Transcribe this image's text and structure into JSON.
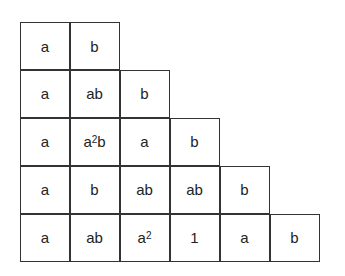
{
  "table": {
    "rows": [
      [
        {
          "base": "a"
        },
        {
          "base": "b"
        }
      ],
      [
        {
          "base": "a"
        },
        {
          "base": "ab"
        },
        {
          "base": "b"
        }
      ],
      [
        {
          "base": "a"
        },
        {
          "pre": "a",
          "sup": "2",
          "post": "b"
        },
        {
          "base": "a"
        },
        {
          "base": "b"
        }
      ],
      [
        {
          "base": "a"
        },
        {
          "base": "b"
        },
        {
          "base": "ab"
        },
        {
          "base": "ab"
        },
        {
          "base": "b"
        }
      ],
      [
        {
          "base": "a"
        },
        {
          "base": "ab"
        },
        {
          "pre": "a",
          "sup": "2",
          "post": ""
        },
        {
          "base": "1"
        },
        {
          "base": "a"
        },
        {
          "base": "b"
        }
      ]
    ]
  }
}
